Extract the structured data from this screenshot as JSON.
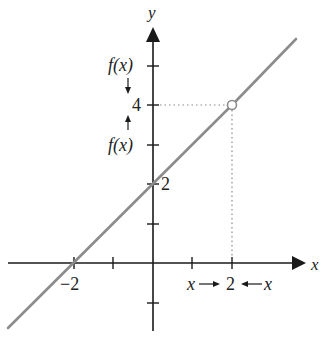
{
  "diagram": {
    "function": "f(x) = x + 2, undefined at x = 2",
    "colors": {
      "axis": "#1a1a1a",
      "curve": "#8c8c8c",
      "guide": "#8c8c8c",
      "text": "#222222"
    },
    "axes": {
      "x_label": "x",
      "y_label": "y"
    },
    "ticks": {
      "x_neg2_label": "−2",
      "x_2_label": "2",
      "y_2_label": "2",
      "y_4_label": "4"
    },
    "annotations": {
      "fx_upper": "f(x)",
      "fx_lower": "f(x)",
      "x_left": "x",
      "x_right": "x"
    },
    "hole_point": {
      "x": 2,
      "y": 4,
      "style": "open-circle"
    }
  }
}
